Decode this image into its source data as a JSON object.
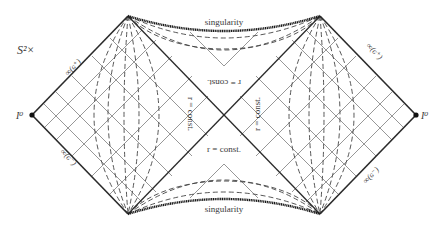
{
  "labels": {
    "sphere": "S²×",
    "singularity_top": "singularity",
    "singularity_bottom": "singularity",
    "spatial_infinity_left": "I⁰",
    "spatial_infinity_right": "I⁰",
    "scri_plus_left": "∞(ɢ⁺)",
    "scri_minus_left": "∞(ɢ⁻)",
    "scri_plus_right": "∞(ɢ⁺)",
    "scri_minus_right": "∞(ɢ⁻)",
    "r_const_top": "r = const.",
    "r_const_bottom": "r = const.",
    "r_const_left": "r = const.",
    "r_const_right": "r = const."
  },
  "colors": {
    "ink": "#2a2a2a",
    "grid": "#555555",
    "background": "#ffffff"
  }
}
